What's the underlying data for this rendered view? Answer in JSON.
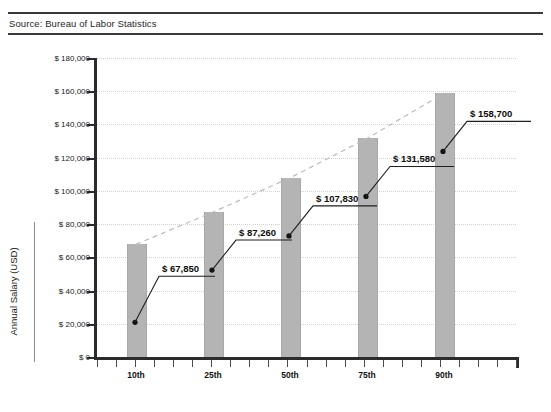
{
  "source": {
    "label": "Source: Bureau of Labor Statistics"
  },
  "chart_data": {
    "type": "bar",
    "title": "",
    "xlabel": "Percentile",
    "ylabel": "Annual Salary (USD)",
    "categories": [
      "10th",
      "25th",
      "50th",
      "75th",
      "90th"
    ],
    "values": [
      67850,
      87260,
      107830,
      131580,
      158700
    ],
    "data_labels": [
      "$ 67,850",
      "$ 87,260",
      "$ 107,830",
      "$ 131,580",
      "$ 158,700"
    ],
    "ylim": [
      0,
      180000
    ],
    "ytick_values": [
      0,
      20000,
      40000,
      60000,
      80000,
      100000,
      120000,
      140000,
      160000,
      180000
    ],
    "ytick_labels": [
      "$ 0",
      "$ 20,000",
      "$ 40,000",
      "$ 60,000",
      "$ 80,000",
      "$ 100,000",
      "$ 120,000",
      "$ 140,000",
      "$ 160,000",
      "$ 180,000"
    ],
    "grid": true,
    "legend": false,
    "bar_color": "#b4b4b4",
    "trendline": {
      "style": "dashed",
      "color": "#b9b9b9",
      "values": [
        67850,
        87260,
        107830,
        131580,
        158700
      ]
    }
  }
}
